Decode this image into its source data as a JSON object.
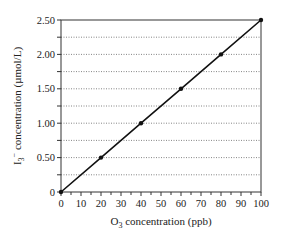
{
  "chart_data": {
    "type": "line",
    "title": "",
    "xlabel": "O3 concentration (ppb)",
    "ylabel": "I3− concentration (µmol/L)",
    "x": [
      0,
      20,
      40,
      60,
      80,
      100
    ],
    "series": [
      {
        "name": "I3− vs O3",
        "values": [
          0,
          0.5,
          1.0,
          1.5,
          2.0,
          2.5
        ]
      }
    ],
    "xlim": [
      0,
      100
    ],
    "ylim": [
      0,
      2.5
    ],
    "xticks": [
      "0",
      "10",
      "20",
      "30",
      "40",
      "50",
      "60",
      "70",
      "80",
      "90",
      "100"
    ],
    "yticks": [
      "0",
      "0.50",
      "1.00",
      "1.50",
      "2.00",
      "2.50"
    ],
    "grid": "horizontal dotted every 0.25",
    "legend": "none"
  },
  "labels": {
    "x_main": "O",
    "x_sub": "3",
    "x_rest": " concentration (ppb)",
    "y_main": "I",
    "y_sub": "3",
    "y_sup": "−",
    "y_rest": " concentration (µmol/L)"
  }
}
